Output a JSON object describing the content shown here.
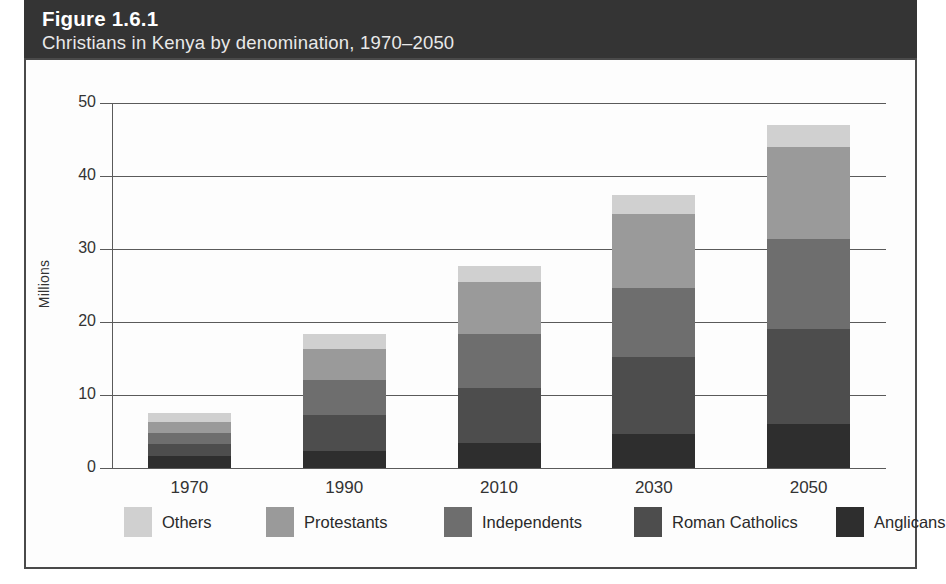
{
  "figure": {
    "number": "Figure 1.6.1",
    "subtitle": "Christians in Kenya by denomination, 1970–2050"
  },
  "chart_data": {
    "type": "bar",
    "stacked": true,
    "title": "Figure 1.6.1",
    "subtitle": "Christians in Kenya by denomination, 1970–2050",
    "xlabel": "",
    "ylabel": "Millions",
    "categories": [
      "1970",
      "1990",
      "2010",
      "2030",
      "2050"
    ],
    "ylim": [
      0,
      50
    ],
    "yticks": [
      0,
      10,
      20,
      30,
      40,
      50
    ],
    "grid": true,
    "legend_position": "bottom",
    "series": [
      {
        "name": "Anglicans",
        "color": "#2e2e2e",
        "values": [
          1.7,
          2.3,
          3.4,
          4.7,
          6.0
        ]
      },
      {
        "name": "Roman Catholics",
        "color": "#4d4d4d",
        "values": [
          1.6,
          5.0,
          7.6,
          10.5,
          13.0
        ]
      },
      {
        "name": "Independents",
        "color": "#6e6e6e",
        "values": [
          1.5,
          4.7,
          7.3,
          9.5,
          12.4
        ]
      },
      {
        "name": "Protestants",
        "color": "#9a9a9a",
        "values": [
          1.5,
          4.3,
          7.2,
          10.1,
          12.6
        ]
      },
      {
        "name": "Others",
        "color": "#d0d0d0",
        "values": [
          1.3,
          2.0,
          2.2,
          2.6,
          3.0
        ]
      }
    ],
    "totals": [
      7.6,
      18.3,
      27.7,
      37.4,
      47.0
    ]
  },
  "legend": {
    "items": [
      {
        "label": "Others",
        "color": "#d0d0d0"
      },
      {
        "label": "Protestants",
        "color": "#9a9a9a"
      },
      {
        "label": "Independents",
        "color": "#6e6e6e"
      },
      {
        "label": "Roman Catholics",
        "color": "#4d4d4d"
      },
      {
        "label": "Anglicans",
        "color": "#2e2e2e"
      }
    ]
  },
  "colors": {
    "header_band": "#343434",
    "panel_border": "#4a4a4a",
    "grid": "#5a5a5a",
    "background": "#ffffff"
  }
}
